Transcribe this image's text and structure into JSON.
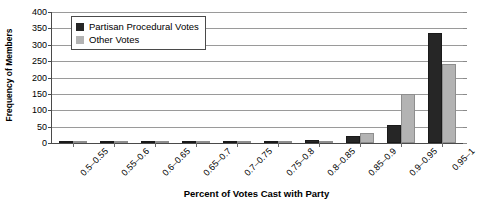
{
  "chart_data": {
    "type": "bar",
    "title": "",
    "xlabel": "Percent of Votes Cast with Party",
    "ylabel": "Frequency of Members",
    "categories": [
      "0.5–0.55",
      "0.55–0.6",
      "0.6–0.65",
      "0.65–0.7",
      "0.7–0.75",
      "0.75–0.8",
      "0.8–0.85",
      "0.85–0.9",
      "0.9–0.95",
      "0.95–1"
    ],
    "series": [
      {
        "name": "Partisan Procedural Votes",
        "color": "#262626",
        "values": [
          0,
          0,
          0,
          0,
          3,
          4,
          9,
          22,
          55,
          335
        ]
      },
      {
        "name": "Other Votes",
        "color": "#b3b3b3",
        "values": [
          0,
          0,
          0,
          0,
          2,
          3,
          6,
          32,
          150,
          240
        ]
      }
    ],
    "ylim": [
      0,
      400
    ],
    "ytick_values": [
      0,
      50,
      100,
      150,
      200,
      250,
      300,
      350,
      400
    ],
    "ytick_labels": [
      "0",
      "50",
      "100",
      "150",
      "200",
      "250",
      "300",
      "350",
      "400"
    ],
    "grid": true,
    "legend_position": "top-left"
  }
}
